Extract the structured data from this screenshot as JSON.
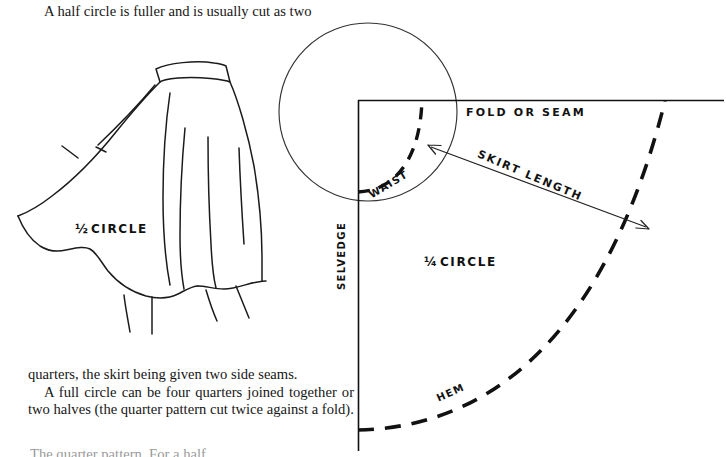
{
  "page": {
    "width": 726,
    "height": 457,
    "background": "#ffffff",
    "ink": "#111111"
  },
  "text": {
    "intro_line": "A half circle is fuller and is usually cut as two",
    "paragraph_1": "quarters, the skirt being given two side seams.",
    "paragraph_2": "A full circle can be four quarters joined together or two halves (the quarter pattern cut twice against a fold).",
    "clipped_bottom_line": "The quarter pattern. For a half"
  },
  "diagram": {
    "skirt_illustration": {
      "name": "half-circle-skirt-drawing",
      "label_fraction": "1/2",
      "label_text": "CIRCLE"
    },
    "construction_circle": {
      "name": "full-circle-outline"
    },
    "pattern": {
      "title_fraction": "1/4",
      "title_text": "CIRCLE",
      "labels": {
        "fold_or_seam": "FOLD  OR  SEAM",
        "skirt_length": "SKIRT  LENGTH",
        "waist": "WAIST",
        "hem": "HEM",
        "selvedge": "SELVEDGE"
      }
    }
  }
}
